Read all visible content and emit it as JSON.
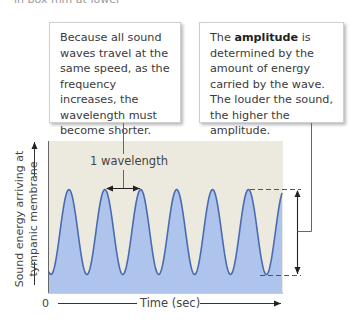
{
  "partial_top_text": "in box mm at lower",
  "callouts": {
    "left": {
      "text": "Because all sound waves travel at the same speed, as the frequency increases, the wavelength must become shorter."
    },
    "right": {
      "text_before": "The ",
      "bold": "amplitude",
      "text_after": " is determined by the amount of energy carried by the wave. The louder the sound, the higher the amplitude."
    }
  },
  "chart": {
    "y_axis_label": "Sound energy arriving at tympanic membrane",
    "x_axis_origin": "0",
    "x_axis_label": "Time (sec)",
    "wavelength_label": "1 wavelength",
    "colors": {
      "background": "#eceadf",
      "wave_fill": "#aec4ec",
      "wave_stroke": "#4a6bb0",
      "annotation": "#555555"
    }
  },
  "chart_data": {
    "type": "line",
    "title": "",
    "xlabel": "Time (sec)",
    "ylabel": "Sound energy arriving at tympanic membrane",
    "cycles_shown": 6.5,
    "peaks": 6,
    "annotations": [
      "1 wavelength (peak-to-peak distance)",
      "amplitude (peak-to-trough vertical arrow)"
    ],
    "x_origin": 0,
    "grid": false
  }
}
